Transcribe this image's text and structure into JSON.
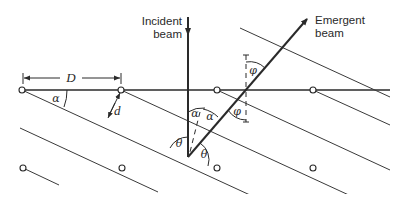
{
  "diagram": {
    "labels": {
      "incident_beam_line1": "Incident",
      "incident_beam_line2": "beam",
      "emergent_beam_line1": "Emergent",
      "emergent_beam_line2": "beam",
      "spacing_D": "D",
      "spacing_d": "d",
      "angle_alpha": "α",
      "angle_theta": "θ",
      "angle_phi": "φ"
    },
    "colors": {
      "line": "#2a2a2a",
      "background": "#ffffff"
    }
  }
}
